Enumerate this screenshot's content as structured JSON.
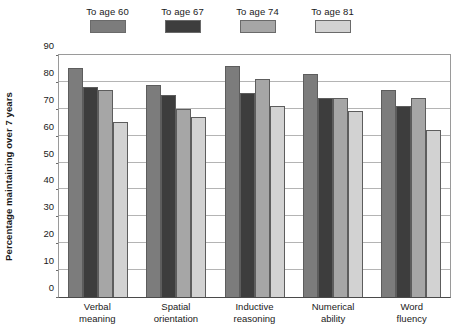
{
  "chart_data": {
    "type": "bar",
    "title": "",
    "xlabel": "",
    "ylabel": "Percentage maintaining over 7 years",
    "ylim": [
      0,
      90
    ],
    "yticks": [
      0,
      10,
      20,
      30,
      40,
      50,
      60,
      70,
      80,
      90
    ],
    "grid": true,
    "legend_position": "top",
    "categories": [
      "Verbal meaning",
      "Spatial orientation",
      "Inductive reasoning",
      "Numerical ability",
      "Word fluency"
    ],
    "category_lines": [
      [
        "Verbal",
        "meaning"
      ],
      [
        "Spatial",
        "orientation"
      ],
      [
        "Inductive",
        "reasoning"
      ],
      [
        "Numerical",
        "ability"
      ],
      [
        "Word",
        "fluency"
      ]
    ],
    "series": [
      {
        "name": "To age 60",
        "color": "#7c7c7c",
        "values": [
          85,
          79,
          86,
          83,
          77
        ]
      },
      {
        "name": "To age 67",
        "color": "#3d3d3d",
        "values": [
          78,
          75,
          76,
          74,
          71
        ]
      },
      {
        "name": "To age 74",
        "color": "#a6a6a6",
        "values": [
          77,
          70,
          81,
          74,
          74
        ]
      },
      {
        "name": "To age 81",
        "color": "#d2d2d2",
        "values": [
          65,
          67,
          71,
          69,
          62
        ]
      }
    ]
  },
  "axis": {
    "tick_labels": [
      "90",
      "80",
      "70",
      "60",
      "50",
      "40",
      "30",
      "20",
      "10",
      "0"
    ]
  }
}
